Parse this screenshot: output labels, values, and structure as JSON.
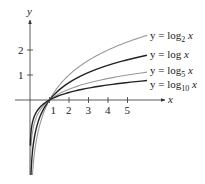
{
  "chart_data": {
    "type": "line",
    "title": "",
    "xlabel": "x",
    "ylabel": "y",
    "x_ticks": [
      "1",
      "2",
      "3",
      "4",
      "5"
    ],
    "y_ticks": [
      "1",
      "2"
    ],
    "xlim": [
      -0.8,
      6.3
    ],
    "ylim": [
      -3.3,
      3.5
    ],
    "grid": false,
    "legend_position": "right, inline labels",
    "series": [
      {
        "name": "y = log₂ x",
        "base": 2,
        "color": "#999999",
        "label_parts": [
          "y = log",
          "2",
          " x"
        ]
      },
      {
        "name": "y = log x",
        "base": 2.718281828,
        "color": "#222222",
        "label_parts": [
          "y = log",
          "",
          " x"
        ]
      },
      {
        "name": "y = log₅ x",
        "base": 5,
        "color": "#999999",
        "label_parts": [
          "y = log",
          "5",
          " x"
        ]
      },
      {
        "name": "y = log₁₀ x",
        "base": 10,
        "color": "#222222",
        "label_parts": [
          "y = log",
          "10",
          " x"
        ]
      }
    ],
    "sample_points": {
      "x": [
        0.05,
        0.1,
        0.25,
        0.5,
        1,
        2,
        3,
        4,
        5,
        6
      ],
      "log2": [
        -4.32,
        -3.32,
        -2.0,
        -1.0,
        0,
        1.0,
        1.58,
        2.0,
        2.32,
        2.58
      ],
      "ln": [
        -3.0,
        -2.3,
        -1.39,
        -0.69,
        0,
        0.69,
        1.1,
        1.39,
        1.61,
        1.79
      ],
      "log5": [
        -1.86,
        -1.43,
        -0.86,
        -0.43,
        0,
        0.43,
        0.68,
        0.86,
        1.0,
        1.11
      ],
      "log10": [
        -1.3,
        -1.0,
        -0.6,
        -0.3,
        0,
        0.3,
        0.48,
        0.6,
        0.7,
        0.78
      ]
    }
  }
}
